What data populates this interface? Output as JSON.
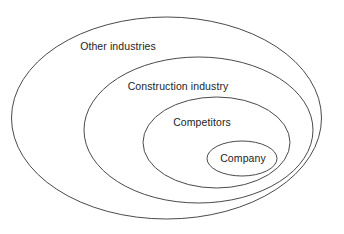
{
  "diagram": {
    "type": "nested-ellipse-venn",
    "title": "",
    "background_color": "#ffffff",
    "stroke_color": "#4a4a4a",
    "text_color": "#1d1d1d",
    "canvas": {
      "width": 344,
      "height": 234
    },
    "levels": [
      {
        "key": "other-industries",
        "label": "Other industries",
        "depth": 1,
        "ellipse": {
          "cx": 166.5,
          "cy": 118,
          "rx": 155,
          "ry": 101
        },
        "label_pos": {
          "x": 118,
          "y": 47
        }
      },
      {
        "key": "construction-industry",
        "label": "Construction industry",
        "depth": 2,
        "ellipse": {
          "cx": 198.5,
          "cy": 130,
          "rx": 114.5,
          "ry": 73
        },
        "label_pos": {
          "x": 178,
          "y": 87
        }
      },
      {
        "key": "competitors",
        "label": "Competitors",
        "depth": 3,
        "ellipse": {
          "cx": 216.5,
          "cy": 142.5,
          "rx": 73.5,
          "ry": 45.5
        },
        "label_pos": {
          "x": 202,
          "y": 123
        }
      },
      {
        "key": "company",
        "label": "Company",
        "depth": 4,
        "ellipse": {
          "cx": 242,
          "cy": 158.5,
          "rx": 35,
          "ry": 17.5
        },
        "label_pos": {
          "x": 243,
          "y": 159
        }
      }
    ]
  }
}
